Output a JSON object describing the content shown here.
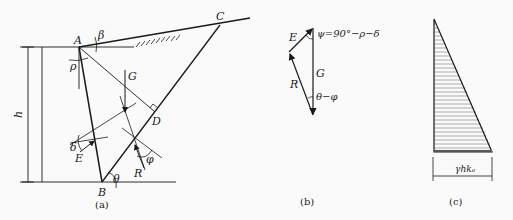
{
  "figure_a": {
    "caption": "(a)",
    "points": {
      "A": "A",
      "B": "B",
      "C": "C",
      "D": "D"
    },
    "forces": {
      "G": "G",
      "E": "E",
      "R": "R"
    },
    "angles": {
      "beta": "β",
      "rho": "ρ",
      "delta": "δ",
      "phi": "φ",
      "theta": "θ"
    },
    "height_label": "h"
  },
  "figure_b": {
    "caption": "(b)",
    "forces": {
      "E": "E",
      "G": "G",
      "R": "R"
    },
    "angle_top": "ψ=90°−ρ−δ",
    "angle_bottom": "θ−φ"
  },
  "figure_c": {
    "caption": "(c)",
    "base_label": "γhkₐ"
  },
  "colors": {
    "line": "#1a1a1a",
    "background": "#fafafa",
    "hatch": "#555555"
  }
}
